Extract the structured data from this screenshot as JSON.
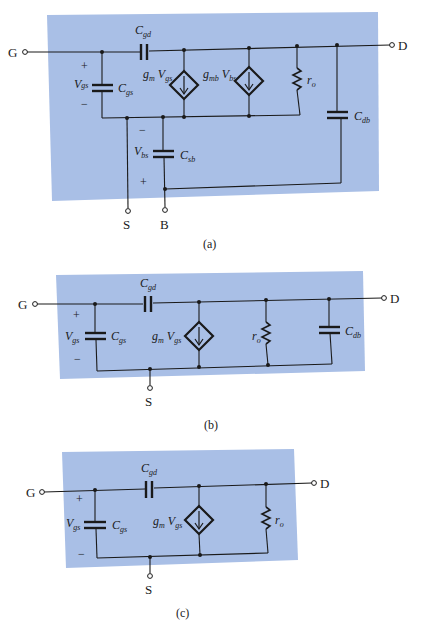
{
  "figures": [
    {
      "id": "a",
      "caption": "(a)",
      "nodes": {
        "gate": "G",
        "drain": "D",
        "source": "S",
        "body": "B"
      },
      "components": {
        "cgd": {
          "base": "C",
          "sub": "gd"
        },
        "cgs": {
          "base": "C",
          "sub": "gs"
        },
        "gm_vgs": {
          "g": "g",
          "gsub": "m",
          "v": "V",
          "vsub": "gs"
        },
        "gmb_vbs": {
          "g": "g",
          "gsub": "mb",
          "v": "V",
          "vsub": "bs"
        },
        "ro": {
          "base": "r",
          "sub": "o"
        },
        "cdb": {
          "base": "C",
          "sub": "db"
        },
        "csb": {
          "base": "C",
          "sub": "sb"
        }
      },
      "voltages": {
        "vgs": {
          "base": "V",
          "sub": "gs",
          "plus": "+",
          "minus": "−"
        },
        "vbs": {
          "base": "V",
          "sub": "bs",
          "plus": "+",
          "minus": "−"
        }
      }
    },
    {
      "id": "b",
      "caption": "(b)",
      "nodes": {
        "gate": "G",
        "drain": "D",
        "source": "S"
      },
      "components": {
        "cgd": {
          "base": "C",
          "sub": "gd"
        },
        "cgs": {
          "base": "C",
          "sub": "gs"
        },
        "gm_vgs": {
          "g": "g",
          "gsub": "m",
          "v": "V",
          "vsub": "gs"
        },
        "ro": {
          "base": "r",
          "sub": "o"
        },
        "cdb": {
          "base": "C",
          "sub": "db"
        }
      },
      "voltages": {
        "vgs": {
          "base": "V",
          "sub": "gs",
          "plus": "+",
          "minus": "−"
        }
      }
    },
    {
      "id": "c",
      "caption": "(c)",
      "nodes": {
        "gate": "G",
        "drain": "D",
        "source": "S"
      },
      "components": {
        "cgd": {
          "base": "C",
          "sub": "gd"
        },
        "cgs": {
          "base": "C",
          "sub": "gs"
        },
        "gm_vgs": {
          "g": "g",
          "gsub": "m",
          "v": "V",
          "vsub": "gs"
        },
        "ro": {
          "base": "r",
          "sub": "o"
        }
      },
      "voltages": {
        "vgs": {
          "base": "V",
          "sub": "gs",
          "plus": "+",
          "minus": "−"
        }
      }
    }
  ],
  "colors": {
    "panel": "#a9bfe6",
    "ink": "#1a1a1a",
    "background": "#ffffff"
  }
}
